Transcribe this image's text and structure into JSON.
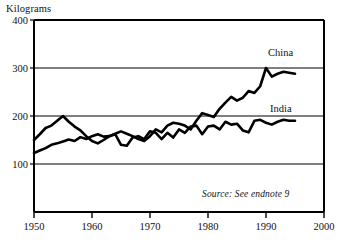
{
  "chart_data": {
    "type": "line",
    "title": "",
    "subtitle": "",
    "xlabel": "",
    "ylabel": "Kilograms",
    "ylim": [
      0,
      400
    ],
    "xlim": [
      1950,
      2000
    ],
    "grid": true,
    "gridlines_y": [
      100,
      200,
      300,
      400
    ],
    "legend_position": "inline-right",
    "y_ticks": [
      {
        "value": 400,
        "label": "400"
      },
      {
        "value": 300,
        "label": "300"
      },
      {
        "value": 200,
        "label": "200"
      },
      {
        "value": 100,
        "label": "100"
      }
    ],
    "x_ticks": [
      {
        "value": 1950,
        "label": "1950"
      },
      {
        "value": 1960,
        "label": "1960"
      },
      {
        "value": 1970,
        "label": "1970"
      },
      {
        "value": 1980,
        "label": "1980"
      },
      {
        "value": 1990,
        "label": "1990"
      },
      {
        "value": 2000,
        "label": "2000"
      }
    ],
    "series": [
      {
        "name": "China",
        "color": "#000000",
        "label": "China",
        "x": [
          1950,
          1951,
          1952,
          1953,
          1954,
          1955,
          1956,
          1957,
          1958,
          1959,
          1960,
          1961,
          1962,
          1963,
          1964,
          1965,
          1966,
          1967,
          1968,
          1969,
          1970,
          1971,
          1972,
          1973,
          1974,
          1975,
          1976,
          1977,
          1978,
          1979,
          1980,
          1981,
          1982,
          1983,
          1984,
          1985,
          1986,
          1987,
          1988,
          1989,
          1990,
          1991,
          1992,
          1993,
          1994,
          1995
        ],
        "values": [
          150,
          162,
          175,
          180,
          190,
          200,
          188,
          178,
          170,
          158,
          148,
          143,
          150,
          158,
          163,
          168,
          163,
          158,
          152,
          148,
          158,
          172,
          166,
          180,
          186,
          184,
          180,
          172,
          190,
          206,
          202,
          198,
          215,
          228,
          240,
          232,
          238,
          252,
          248,
          262,
          300,
          282,
          288,
          292,
          290,
          288
        ]
      },
      {
        "name": "India",
        "color": "#000000",
        "label": "India",
        "x": [
          1950,
          1951,
          1952,
          1953,
          1954,
          1955,
          1956,
          1957,
          1958,
          1959,
          1960,
          1961,
          1962,
          1963,
          1964,
          1965,
          1966,
          1967,
          1968,
          1969,
          1970,
          1971,
          1972,
          1973,
          1974,
          1975,
          1976,
          1977,
          1978,
          1979,
          1980,
          1981,
          1982,
          1983,
          1984,
          1985,
          1986,
          1987,
          1988,
          1989,
          1990,
          1991,
          1992,
          1993,
          1994,
          1995
        ],
        "values": [
          123,
          128,
          133,
          140,
          143,
          147,
          151,
          148,
          156,
          152,
          158,
          162,
          157,
          158,
          162,
          140,
          138,
          155,
          158,
          152,
          168,
          165,
          152,
          165,
          155,
          172,
          165,
          178,
          180,
          162,
          178,
          180,
          172,
          188,
          182,
          184,
          170,
          166,
          190,
          192,
          186,
          182,
          188,
          192,
          190,
          190
        ]
      }
    ],
    "annotations": [
      {
        "name": "source-note",
        "text": "Source: See endnote 9"
      }
    ]
  },
  "labels": {
    "y_unit": "Kilograms",
    "china": "China",
    "india": "India",
    "source": "Source: See endnote 9"
  },
  "colors": {
    "line": "#000000",
    "frame": "#000000",
    "grid": "#000000",
    "background": "#ffffff",
    "text": "#111111"
  }
}
